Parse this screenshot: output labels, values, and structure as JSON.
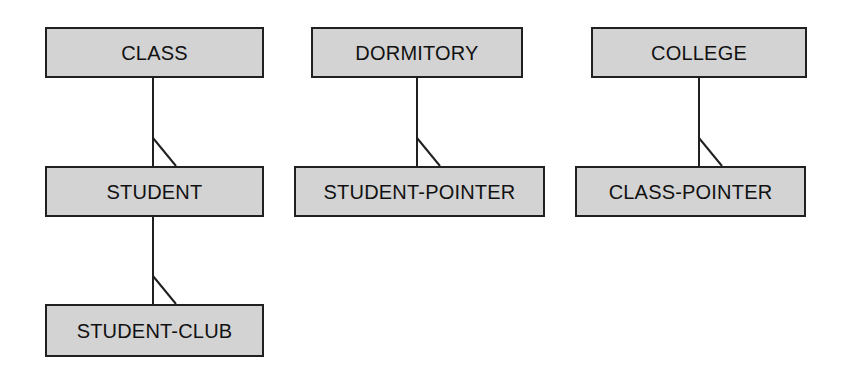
{
  "diagram": {
    "type": "bachman-data-structure-diagram",
    "title": "",
    "background_color": "#ffffff",
    "box_fill_color": "#d3d3d3",
    "box_border_color": "#202020",
    "connector_color": "#202020",
    "text_color": "#111111",
    "columns": [
      {
        "name": "class-student-club-chain",
        "nodes": [
          "class",
          "student",
          "student-club"
        ]
      },
      {
        "name": "dormitory-student-pointer-chain",
        "nodes": [
          "dormitory",
          "student-pointer"
        ]
      },
      {
        "name": "college-class-pointer-chain",
        "nodes": [
          "college",
          "class-pointer"
        ]
      }
    ],
    "nodes": [
      {
        "id": "class",
        "label": "CLASS",
        "x": 45,
        "y": 27,
        "width": 219,
        "height": 51
      },
      {
        "id": "student",
        "label": "STUDENT",
        "x": 45,
        "y": 166,
        "width": 219,
        "height": 51
      },
      {
        "id": "student-club",
        "label": "STUDENT-CLUB",
        "x": 45,
        "y": 304,
        "width": 219,
        "height": 53
      },
      {
        "id": "dormitory",
        "label": "DORMITORY",
        "x": 311,
        "y": 27,
        "width": 212,
        "height": 51
      },
      {
        "id": "student-pointer",
        "label": "STUDENT-POINTER",
        "x": 294,
        "y": 166,
        "width": 251,
        "height": 51
      },
      {
        "id": "college",
        "label": "COLLEGE",
        "x": 591,
        "y": 27,
        "width": 216,
        "height": 51
      },
      {
        "id": "class-pointer",
        "label": "CLASS-POINTER",
        "x": 575,
        "y": 166,
        "width": 231,
        "height": 51
      }
    ],
    "connectors": [
      {
        "id": "class-to-student",
        "from": "class",
        "to": "student",
        "notation": "crow-foot-branch",
        "stem_x": 153,
        "stem_y1": 78,
        "stem_y2": 166,
        "branch_x1": 153,
        "branch_y1": 138,
        "branch_x2": 176,
        "branch_y2": 166
      },
      {
        "id": "student-to-student-club",
        "from": "student",
        "to": "student-club",
        "notation": "crow-foot-branch",
        "stem_x": 153,
        "stem_y1": 217,
        "stem_y2": 304,
        "branch_x1": 153,
        "branch_y1": 276,
        "branch_x2": 176,
        "branch_y2": 304
      },
      {
        "id": "dormitory-to-student-pointer",
        "from": "dormitory",
        "to": "student-pointer",
        "notation": "crow-foot-branch",
        "stem_x": 417,
        "stem_y1": 78,
        "stem_y2": 166,
        "branch_x1": 417,
        "branch_y1": 138,
        "branch_x2": 440,
        "branch_y2": 166
      },
      {
        "id": "college-to-class-pointer",
        "from": "college",
        "to": "class-pointer",
        "notation": "crow-foot-branch",
        "stem_x": 699,
        "stem_y1": 78,
        "stem_y2": 166,
        "branch_x1": 699,
        "branch_y1": 138,
        "branch_x2": 722,
        "branch_y2": 166
      }
    ]
  }
}
